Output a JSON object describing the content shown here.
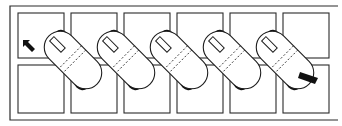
{
  "diagram": {
    "title": "",
    "grid": {
      "rows": 2,
      "columns": 6
    },
    "capsule_count": 5,
    "start_marker": "arrow-up-left",
    "end_marker": "bar",
    "colors": {
      "line": "#2a2a2a",
      "fill": "#ffffff",
      "accent": "#111111"
    }
  }
}
